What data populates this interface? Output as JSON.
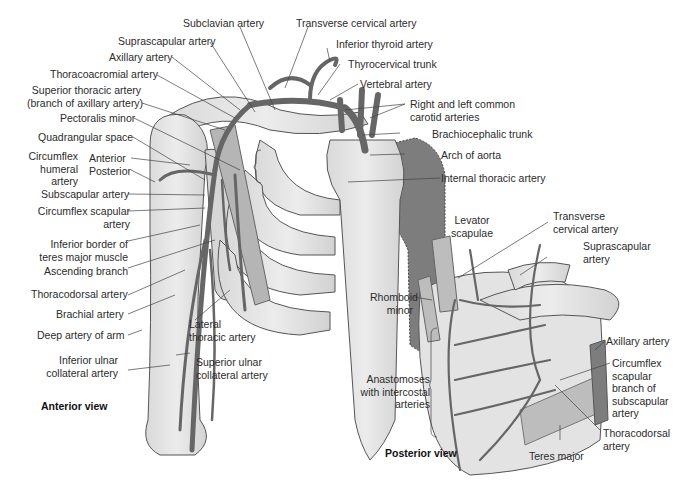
{
  "figure": {
    "views": {
      "anterior": "Anterior view",
      "posterior": "Posterior view"
    },
    "anterior_labels": {
      "subclavian_artery": "Subclavian artery",
      "transverse_cervical_artery": "Transverse cervical artery",
      "suprascapular_artery": "Suprascapular artery",
      "inferior_thyroid_artery": "Inferior thyroid artery",
      "axillary_artery": "Axillary artery",
      "thyrocervical_trunk": "Thyrocervical trunk",
      "thoracoacromial_artery": "Thoracoacromial artery",
      "vertebral_artery": "Vertebral artery",
      "superior_thoracic_artery_1": "Superior thoracic artery",
      "superior_thoracic_artery_2": "(branch of axillary artery)",
      "common_carotid_1": "Right and left common",
      "common_carotid_2": "carotid arteries",
      "pectoralis_minor": "Pectoralis minor",
      "brachiocephalic_trunk": "Brachiocephalic trunk",
      "quadrangular_space": "Quadrangular space",
      "circumflex_humeral_1": "Circumflex",
      "circumflex_humeral_2": "humeral",
      "circumflex_humeral_3": "artery",
      "anterior": "Anterior",
      "posterior": "Posterior",
      "arch_of_aorta": "Arch of aorta",
      "internal_thoracic_artery": "Internal thoracic artery",
      "subscapular_artery": "Subscapular artery",
      "circumflex_scapular_1": "Circumflex scapular",
      "circumflex_scapular_2": "artery",
      "inferior_border_1": "Inferior border of",
      "inferior_border_2": "teres major muscle",
      "ascending_branch": "Ascending branch",
      "thoracodorsal_artery": "Thoracodorsal artery",
      "brachial_artery": "Brachial artery",
      "deep_artery_of_arm": "Deep artery of arm",
      "lateral_thoracic_1": "Lateral",
      "lateral_thoracic_2": "thoracic artery",
      "inferior_ulnar_1": "Inferior ulnar",
      "inferior_ulnar_2": "collateral artery",
      "superior_ulnar_1": "Superior ulnar",
      "superior_ulnar_2": "collateral artery"
    },
    "posterior_labels": {
      "levator_scapulae_1": "Levator",
      "levator_scapulae_2": "scapulae",
      "transverse_cervical_1": "Transverse",
      "transverse_cervical_2": "cervical artery",
      "suprascapular_1": "Suprascapular",
      "suprascapular_2": "artery",
      "rhomboid_minor_1": "Rhomboid",
      "rhomboid_minor_2": "minor",
      "axillary_artery": "Axillary artery",
      "circumflex_scapular_1": "Circumflex",
      "circumflex_scapular_2": "scapular",
      "circumflex_scapular_3": "branch of",
      "circumflex_scapular_4": "subscapular",
      "circumflex_scapular_5": "artery",
      "anastomoses_1": "Anastomoses",
      "anastomoses_2": "with intercostal",
      "anastomoses_3": "arteries",
      "thoracodorsal_1": "Thoracodorsal",
      "thoracodorsal_2": "artery",
      "teres_major": "Teres major"
    },
    "colors": {
      "bone": "#e6e6e6",
      "bone_outline": "#555555",
      "artery": "#6a6a6a",
      "aorta": "#7d7d7d",
      "leader": "#444444"
    }
  }
}
